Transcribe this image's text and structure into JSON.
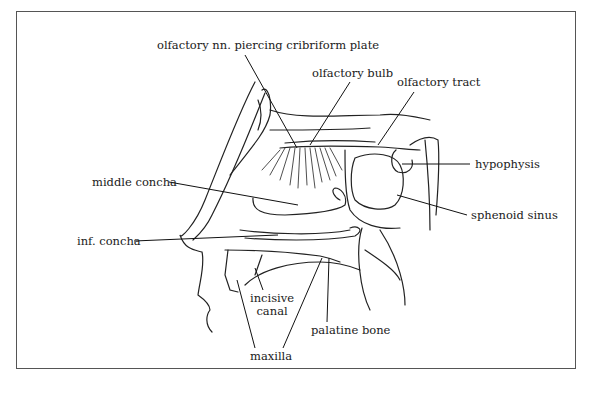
{
  "diagram": {
    "title": "",
    "labels": [
      {
        "id": "olfactory-nn",
        "text": "olfactory nn. piercing cribriform plate",
        "x": 157,
        "y": 39
      },
      {
        "id": "olfactory-bulb",
        "text": "olfactory bulb",
        "x": 312,
        "y": 67
      },
      {
        "id": "olfactory-tract",
        "text": "olfactory tract",
        "x": 397,
        "y": 76
      },
      {
        "id": "hypophysis",
        "text": "hypophysis",
        "x": 475,
        "y": 157
      },
      {
        "id": "middle-concha",
        "text": "middle concha",
        "x": 92,
        "y": 176
      },
      {
        "id": "sphenoid-sinus",
        "text": "sphenoid sinus",
        "x": 471,
        "y": 209
      },
      {
        "id": "inf-concha",
        "text": "inf. concha",
        "x": 77,
        "y": 235
      },
      {
        "id": "incisive-canal",
        "text": "incisive\ncanal",
        "x": 250,
        "y": 292
      },
      {
        "id": "palatine-bone",
        "text": "palatine bone",
        "x": 311,
        "y": 324
      },
      {
        "id": "maxilla",
        "text": "maxilla",
        "x": 250,
        "y": 350
      }
    ]
  }
}
